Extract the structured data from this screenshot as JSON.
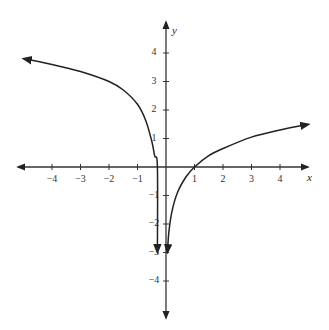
{
  "chart_data": {
    "type": "line",
    "title": "",
    "xlabel": "x",
    "ylabel": "y",
    "xlim": [
      -5,
      5
    ],
    "ylim": [
      -5,
      5
    ],
    "grid": false,
    "x_ticks": [
      -4,
      -3,
      -2,
      -1,
      1,
      2,
      3,
      4
    ],
    "y_ticks": [
      4,
      3,
      2,
      1,
      -1,
      -2,
      -3,
      -4
    ],
    "x_tick_labels": [
      "−4",
      "−3",
      "−2",
      "−1",
      "1",
      "2",
      "3",
      "4"
    ],
    "y_tick_labels": [
      "4",
      "3",
      "2",
      "1",
      "−1",
      "−2",
      "−3",
      "−4"
    ],
    "series": [
      {
        "name": "left-branch",
        "x": [
          -5,
          -4,
          -3,
          -2,
          -1.5,
          -1,
          -0.7,
          -0.5,
          -0.4,
          -0.3,
          -0.3
        ],
        "y": [
          3.8,
          3.6,
          3.35,
          3.0,
          2.7,
          2.2,
          1.6,
          0.9,
          0.4,
          0,
          -3
        ]
      },
      {
        "name": "right-branch",
        "x": [
          0.05,
          0.1,
          0.2,
          0.4,
          0.7,
          1,
          1.5,
          2,
          3,
          4,
          5
        ],
        "y": [
          -3,
          -2.3,
          -1.6,
          -0.9,
          -0.35,
          0,
          0.4,
          0.65,
          1.05,
          1.3,
          1.5
        ]
      }
    ],
    "annotations": [
      "arrowheads on both axes ends",
      "arrowheads on curve ends"
    ]
  }
}
